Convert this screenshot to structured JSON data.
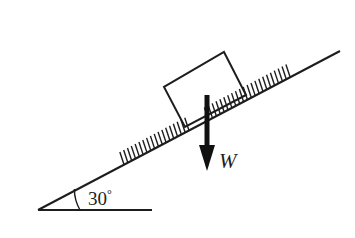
{
  "figure": {
    "type": "physics-free-body-diagram",
    "background_color": "#ffffff",
    "ink_color": "#1d1d1d",
    "width": 355,
    "height": 238
  },
  "labels": {
    "angle_value": "30",
    "angle_degree_symbol": "°",
    "angle_full": "30°",
    "weight_vector": "W"
  },
  "geometry": {
    "incline": {
      "name": "inclined-surface",
      "angle_degrees": 30,
      "apex_x": 38,
      "apex_y": 210,
      "top_x": 340,
      "top_y": 51,
      "hatching": "true",
      "hatch_side": "above"
    },
    "ground": {
      "name": "horizontal-ground-line",
      "start_x": 38,
      "start_y": 210,
      "end_x": 152,
      "end_y": 210
    },
    "angle_arc": {
      "center_x": 38,
      "center_y": 210,
      "radius": 42,
      "start_angle_degrees": 0,
      "end_angle_degrees": 30
    },
    "block": {
      "name": "block-on-incline",
      "corners": [
        {
          "x": 224,
          "y": 52
        },
        {
          "x": 246,
          "y": 95
        },
        {
          "x": 185,
          "y": 127
        },
        {
          "x": 164,
          "y": 87
        }
      ]
    },
    "weight_arrow": {
      "name": "weight-force-vector",
      "shaft_x": 207,
      "shaft_top_y": 95,
      "shaft_bottom_y": 148,
      "head_tip_x": 207,
      "head_tip_y": 171,
      "head_half_width": 8,
      "head_top_y": 145,
      "label_x": 219,
      "label_y": 168,
      "direction": "down"
    }
  },
  "hatch_marks": {
    "lower_segment": {
      "start_t": 0.285,
      "end_t": 0.5,
      "count": 18
    },
    "upper_segment": {
      "start_t": 0.565,
      "end_t": 0.835,
      "count": 22
    },
    "tick_length": 9,
    "tick_lean_degrees": 62
  }
}
